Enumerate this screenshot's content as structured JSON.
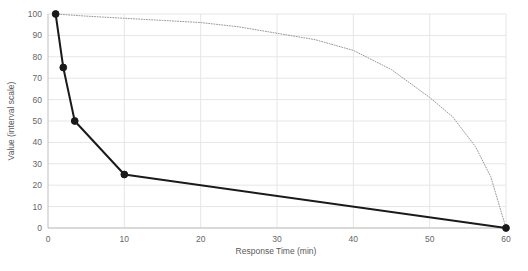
{
  "chart_data": {
    "type": "line",
    "title": "",
    "xlabel": "Response Time (min)",
    "ylabel": "Value (interval scale)",
    "xlim": [
      0,
      60
    ],
    "ylim": [
      0,
      100
    ],
    "xticks": [
      "0",
      "10",
      "20",
      "30",
      "40",
      "50",
      "60"
    ],
    "yticks": [
      "0",
      "10",
      "20",
      "30",
      "40",
      "50",
      "60",
      "70",
      "80",
      "90",
      "100"
    ],
    "grid": true,
    "legend": "none",
    "series": [
      {
        "name": "solid-decay",
        "style": "solid",
        "markers": true,
        "color": "#1a1a1a",
        "x": [
          1,
          2,
          3.5,
          10,
          60
        ],
        "y": [
          100,
          75,
          50,
          25,
          0
        ]
      },
      {
        "name": "dotted-decay",
        "style": "dotted",
        "markers": false,
        "color": "#9a9a9a",
        "x": [
          1,
          5,
          10,
          15,
          20,
          25,
          30,
          35,
          40,
          45,
          50,
          53,
          56,
          58,
          60
        ],
        "y": [
          100,
          99,
          98,
          97,
          96,
          94,
          91,
          88,
          83,
          74,
          61,
          52,
          38,
          24,
          0
        ]
      }
    ]
  },
  "colors": {
    "grid": "#e6e6e6",
    "axis": "#bfbfbf",
    "solid_series": "#1a1a1a",
    "dotted_series": "#9a9a9a",
    "tick_text": "#666666",
    "background": "#ffffff"
  }
}
